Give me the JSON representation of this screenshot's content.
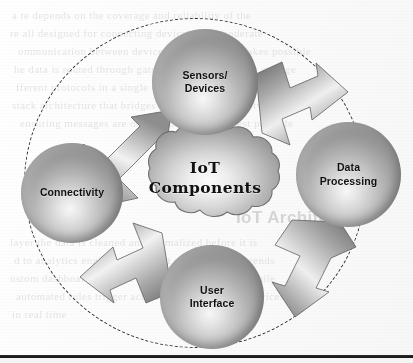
{
  "diagram": {
    "title": "IoT Components",
    "center": {
      "label_line1": "IoT",
      "label_line2": "Components",
      "shape": "cloud"
    },
    "nodes": [
      {
        "id": "sensors-devices",
        "label_line1": "Sensors/",
        "label_line2": "Devices",
        "position": "top",
        "shape": "sphere"
      },
      {
        "id": "data-processing",
        "label_line1": "Data",
        "label_line2": "Processing",
        "position": "right",
        "shape": "sphere"
      },
      {
        "id": "user-interface",
        "label_line1": "User",
        "label_line2": "Interface",
        "position": "bottom",
        "shape": "sphere"
      },
      {
        "id": "connectivity",
        "label_line1": "Connectivity",
        "label_line2": "",
        "position": "left",
        "shape": "sphere"
      }
    ],
    "flow": [
      {
        "from": "connectivity",
        "to": "sensors-devices",
        "direction": "up-right"
      },
      {
        "from": "sensors-devices",
        "to": "data-processing",
        "direction": "down-right"
      },
      {
        "from": "data-processing",
        "to": "user-interface",
        "direction": "down-left"
      },
      {
        "from": "user-interface",
        "to": "connectivity",
        "direction": "up-left"
      }
    ],
    "orbit": {
      "style": "dashed",
      "shape": "ellipse"
    },
    "colors": {
      "sphere_light": "#f7f7f6",
      "sphere_dark": "#737370",
      "arrow_light": "#fafafa",
      "arrow_dark": "#6f6f6c",
      "outline": "#2f2f2f",
      "text": "#10100f",
      "page": "#fdfdfc"
    }
  },
  "background": {
    "ghost_lines": [
      "a  te  depends  on  the  coverage  and  reliability  of  the",
      "re  all  designed  for  connecting  devices  over  moderate",
      "ommunication  between  devices  and  the  cloud  makes  possible",
      "he  data  is  routed  through  gateways  before  reaching  storage",
      "fferent  protocols  in  a  single  deployment  with  a  dual",
      "stack  architecture  that  bridges  local  and  remote  networks",
      "ensuring  messages  are  delivered  with  the  lowest  possible"
    ],
    "ghost_heading": "IoT  Architecture",
    "ghost_lines_lower": [
      "layer  the  data  is  cleaned  and  normalized  before  it  is",
      "d  to  analytics  engines  that  detect  anomalies  and  trends",
      "ustom  dashboards  present  the  results  to  operators  while",
      "automated  rules  trigger  actions  back  to  the  edge  devices",
      "in  real  time"
    ]
  }
}
